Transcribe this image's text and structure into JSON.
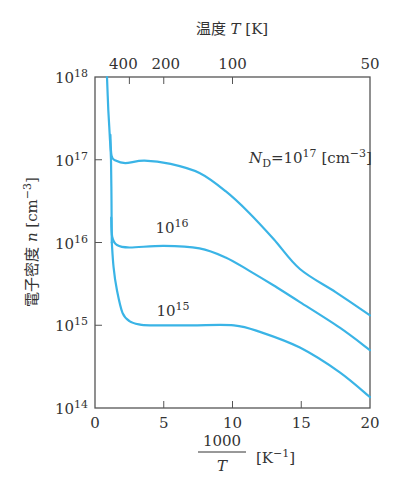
{
  "chart_data": {
    "type": "line",
    "title": "",
    "xlabel": "1000/T [K^-1]",
    "xlabel_parts": {
      "numerator": "1000",
      "denominator": "T",
      "unit": "[K",
      "unit_sup": "−1",
      "unit_close": "]"
    },
    "ylabel": "電子密度 n [cm^-3]",
    "ylabel_parts": {
      "text": "電子密度",
      "var": "n",
      "unit": "[cm",
      "unit_sup": "−3",
      "unit_close": "]"
    },
    "top_xlabel": "温度 T [K]",
    "top_xlabel_parts": {
      "text": "温度",
      "var": "T",
      "unit": "[K]"
    },
    "xlim": [
      0,
      20
    ],
    "ylim_log10": [
      14,
      18
    ],
    "yscale": "log",
    "grid": false,
    "x_ticks": [
      0,
      5,
      10,
      15,
      20
    ],
    "x_tick_labels": [
      "0",
      "5",
      "10",
      "15",
      "20"
    ],
    "y_ticks_exp": [
      14,
      15,
      16,
      17,
      18
    ],
    "y_tick_labels": [
      {
        "base": "10",
        "exp": "14"
      },
      {
        "base": "10",
        "exp": "15"
      },
      {
        "base": "10",
        "exp": "16"
      },
      {
        "base": "10",
        "exp": "17"
      },
      {
        "base": "10",
        "exp": "18"
      }
    ],
    "top_ticks_T": [
      400,
      200,
      100,
      50
    ],
    "top_tick_labels": [
      "400",
      "200",
      "100",
      "50"
    ],
    "line_color": "#3ab4e6",
    "series": [
      {
        "name": "N_D=1e17",
        "label": {
          "prefix": "N",
          "sub": "D",
          "eq": "=10",
          "exp": "17",
          "unit": " [cm",
          "unit_sup": "−3",
          "unit_close": "]"
        },
        "x": [
          1.12,
          1.2,
          1.5,
          2.2,
          3.6,
          5.5,
          7.6,
          9.5,
          11.2,
          13.0,
          14.9,
          17.5,
          20
        ],
        "log10_n": [
          17.3,
          17.05,
          16.99,
          16.96,
          16.99,
          16.95,
          16.84,
          16.62,
          16.36,
          16.04,
          15.68,
          15.4,
          15.12
        ]
      },
      {
        "name": "N_D=1e16",
        "label": {
          "base": "10",
          "exp": "16"
        },
        "x": [
          1.18,
          1.25,
          1.6,
          2.5,
          5.0,
          7.6,
          9.5,
          11.2,
          13.0,
          14.9,
          17.8,
          20
        ],
        "log10_n": [
          16.3,
          16.07,
          15.97,
          15.94,
          15.96,
          15.93,
          15.82,
          15.66,
          15.48,
          15.28,
          14.97,
          14.7
        ]
      },
      {
        "name": "N_D=1e15",
        "label": {
          "base": "10",
          "exp": "15"
        },
        "x": [
          1.22,
          1.35,
          1.6,
          2.0,
          2.5,
          3.2,
          4.0,
          7.0,
          10.1,
          12.0,
          14.9,
          17.8,
          20
        ],
        "log10_n": [
          16.0,
          15.7,
          15.42,
          15.15,
          15.05,
          15.01,
          15.0,
          15.0,
          15.0,
          14.92,
          14.73,
          14.43,
          14.13
        ]
      },
      {
        "name": "intrinsic-rise",
        "x": [
          0.87,
          0.97,
          1.07,
          1.16,
          1.2,
          1.22
        ],
        "log10_n": [
          18.0,
          17.6,
          17.3,
          17.0,
          16.5,
          16.0
        ]
      }
    ]
  }
}
